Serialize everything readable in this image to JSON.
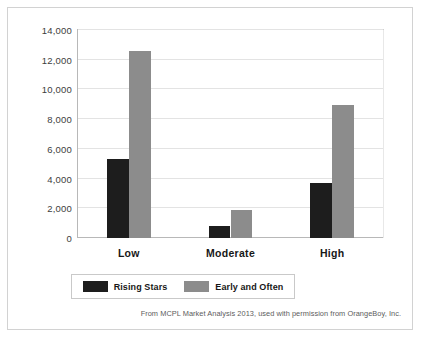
{
  "chart_data": {
    "type": "bar",
    "title": "",
    "subtitle": "",
    "xlabel": "",
    "ylabel": "",
    "categories": [
      "Low",
      "Moderate",
      "High"
    ],
    "series": [
      {
        "name": "Rising Stars",
        "color": "#1d1d1d",
        "values": [
          5300,
          800,
          3700
        ]
      },
      {
        "name": "Early and Often",
        "color": "#8c8c8c",
        "values": [
          12600,
          1880,
          8950
        ]
      }
    ],
    "ylim": [
      0,
      14000
    ],
    "ytick_values": [
      0,
      2000,
      4000,
      6000,
      8000,
      10000,
      12000,
      14000
    ],
    "ytick_labels": [
      "0",
      "2,000",
      "4,000",
      "6,000",
      "8,000",
      "10,000",
      "12,000",
      "14,000"
    ],
    "grid": true,
    "legend_position": "bottom"
  },
  "legend": {
    "entries": [
      {
        "label": "Rising Stars",
        "swatch": "dark"
      },
      {
        "label": "Early and Often",
        "swatch": "gray"
      }
    ]
  },
  "caption": {
    "text": "From MCPL Market Analysis 2013, used with permission from OrangeBoy, Inc."
  },
  "colors": {
    "series_dark": "#1d1d1d",
    "series_gray": "#8c8c8c",
    "gridline": "#e3e3e3",
    "axis": "#b8b8b8",
    "frame": "#d2d2d2"
  }
}
